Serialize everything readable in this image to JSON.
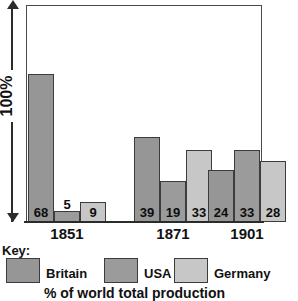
{
  "chart_data": {
    "type": "bar",
    "title": "",
    "subtitle": "",
    "caption": "% of world total production",
    "xlabel": "",
    "ylabel": "100%",
    "yaxis_label": "100%",
    "ylim": [
      0,
      100
    ],
    "grid": false,
    "legend_position": "bottom",
    "legend_title": "Key:",
    "categories": [
      "1851",
      "1871",
      "1901"
    ],
    "series": [
      {
        "name": "Britain",
        "color": "#969696",
        "values": [
          68,
          39,
          24
        ]
      },
      {
        "name": "USA",
        "color": "#9b9b9b",
        "values": [
          5,
          19,
          33
        ]
      },
      {
        "name": "Germany",
        "color": "#c7c7c7",
        "values": [
          9,
          33,
          28
        ]
      }
    ],
    "value_labels": [
      "68",
      "5",
      "9",
      "39",
      "19",
      "33",
      "24",
      "33",
      "28"
    ],
    "tick_labels": {
      "y": [
        "100%"
      ],
      "x": [
        "1851",
        "1871",
        "1901"
      ]
    }
  },
  "axis": {
    "y_arrow_label": "100%",
    "arrow_up_icon": "arrow-up-icon",
    "arrow_down_icon": "arrow-down-icon"
  },
  "groups": [
    {
      "year": "1851",
      "bars": [
        {
          "series": "Britain",
          "value": 68,
          "label": "68",
          "label_inside": true
        },
        {
          "series": "USA",
          "value": 5,
          "label": "5",
          "label_inside": false
        },
        {
          "series": "Germany",
          "value": 9,
          "label": "9",
          "label_inside": true
        }
      ]
    },
    {
      "year": "1871",
      "bars": [
        {
          "series": "Britain",
          "value": 39,
          "label": "39",
          "label_inside": true
        },
        {
          "series": "USA",
          "value": 19,
          "label": "19",
          "label_inside": true
        },
        {
          "series": "Germany",
          "value": 33,
          "label": "33",
          "label_inside": true
        }
      ]
    },
    {
      "year": "1901",
      "bars": [
        {
          "series": "Britain",
          "value": 24,
          "label": "24",
          "label_inside": true
        },
        {
          "series": "USA",
          "value": 33,
          "label": "33",
          "label_inside": true
        },
        {
          "series": "Germany",
          "value": 28,
          "label": "28",
          "label_inside": true
        }
      ]
    }
  ],
  "key": {
    "title": "Key:",
    "items": [
      {
        "label": "Britain",
        "color": "#969696"
      },
      {
        "label": "USA",
        "color": "#9b9b9b"
      },
      {
        "label": "Germany",
        "color": "#c7c7c7"
      }
    ]
  },
  "caption": "% of world total production"
}
